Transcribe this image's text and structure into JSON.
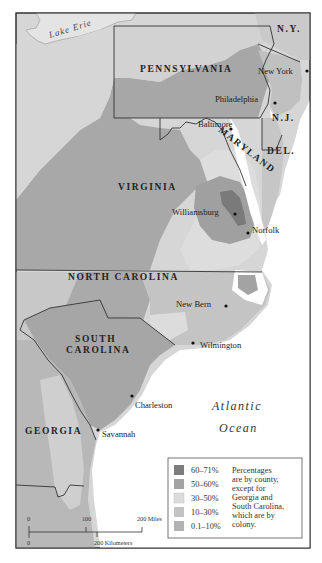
{
  "map": {
    "water_labels": {
      "lake": "Lake Erie",
      "ocean_line1": "Atlantic",
      "ocean_line2": "Ocean"
    },
    "colony_labels": {
      "ny": "N.Y.",
      "pa": "PENNSYLVANIA",
      "nj": "N.J.",
      "del": "DEL.",
      "md": "MARYLAND",
      "va": "VIRGINIA",
      "nc": "NORTH CAROLINA",
      "sc_line1": "SOUTH",
      "sc_line2": "CAROLINA",
      "ga": "GEORGIA"
    },
    "cities": [
      {
        "name": "New York"
      },
      {
        "name": "Philadelphia"
      },
      {
        "name": "Baltimore"
      },
      {
        "name": "Williamsburg"
      },
      {
        "name": "Norfolk"
      },
      {
        "name": "New Bern"
      },
      {
        "name": "Wilmington"
      },
      {
        "name": "Charleston"
      },
      {
        "name": "Savannah"
      }
    ],
    "colors": {
      "c60_71": "#7d7d7d",
      "c50_60": "#a3a3a3",
      "c30_50": "#dcdcdc",
      "c10_30": "#c3c3c3",
      "c01_10": "#b2b2b2",
      "land_light": "#d0d0d0",
      "water": "#ffffff",
      "border": "#333333"
    }
  },
  "legend": {
    "items": [
      {
        "label": "60–71%",
        "color": "#7d7d7d"
      },
      {
        "label": "50–60%",
        "color": "#a3a3a3"
      },
      {
        "label": "30–50%",
        "color": "#dcdcdc"
      },
      {
        "label": "10–30%",
        "color": "#c3c3c3"
      },
      {
        "label": "0.1–10%",
        "color": "#b2b2b2"
      }
    ],
    "note_lines": [
      "Percentages",
      "are by county,",
      "except for",
      "Georgia and",
      "South Carolina,",
      "which are by",
      "colony."
    ]
  },
  "scale_bar": {
    "miles_ticks": [
      "0",
      "100",
      "200 Miles"
    ],
    "km_ticks": [
      "0",
      "200 Kilometers"
    ]
  }
}
